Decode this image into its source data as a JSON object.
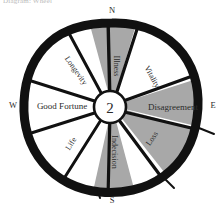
{
  "caption": "Diagram: Wheel",
  "figure": {
    "center_label": "2",
    "compass": {
      "north": "N",
      "south": "S",
      "west": "W",
      "east": "E"
    },
    "colors": {
      "rim": "#111111",
      "shaded_wedge": "#a8a8a8",
      "plain_wedge": "#ffffff",
      "spoke": "#111111",
      "text": "#2b2b2b"
    },
    "sectors": [
      {
        "label": "Illness",
        "shaded": true,
        "orientation": "vertical",
        "angle": -90
      },
      {
        "label": "Vitality",
        "shaded": false,
        "orientation": "diagonal",
        "angle": -45
      },
      {
        "label": "Disagreement",
        "shaded": true,
        "orientation": "horizontal",
        "angle": 0
      },
      {
        "label": "Loss",
        "shaded": true,
        "orientation": "diagonal",
        "angle": 45
      },
      {
        "label": "Indecision",
        "shaded": true,
        "orientation": "vertical",
        "angle": 90
      },
      {
        "label": "Life",
        "shaded": false,
        "orientation": "diagonal",
        "angle": 135
      },
      {
        "label": "Good Fortune",
        "shaded": false,
        "orientation": "horizontal",
        "angle": 180
      },
      {
        "label": "Longevity",
        "shaded": false,
        "orientation": "diagonal",
        "angle": -135
      }
    ]
  }
}
